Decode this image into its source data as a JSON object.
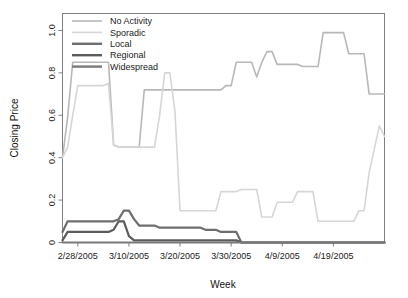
{
  "chart_data": {
    "type": "line",
    "title": "",
    "xlabel": "Week",
    "ylabel": "Closing Price",
    "ylim": [
      0,
      1.08
    ],
    "yticks": [
      0,
      0.2,
      0.4,
      0.6,
      0.8,
      1.0
    ],
    "ytick_labels": [
      "0",
      "0.2",
      "0.4",
      "0.6",
      "0.8",
      "1.0"
    ],
    "xtick_labels": [
      "2/28/2005",
      "3/10/2005",
      "3/20/2005",
      "3/30/2005",
      "4/9/2005",
      "4/19/2005"
    ],
    "xtick_positions": [
      3,
      13,
      23,
      33,
      43,
      53
    ],
    "xlim": [
      0,
      63
    ],
    "grid": false,
    "legend_position": "top-left",
    "series": [
      {
        "name": "No Activity",
        "color": "#b8b8b8",
        "width": 1.6,
        "x": [
          0,
          1,
          2,
          3,
          4,
          5,
          6,
          7,
          8,
          9,
          10,
          11,
          12,
          13,
          14,
          15,
          16,
          17,
          18,
          19,
          20,
          21,
          22,
          23,
          24,
          25,
          26,
          27,
          28,
          29,
          30,
          31,
          32,
          33,
          34,
          35,
          36,
          37,
          38,
          39,
          40,
          41,
          42,
          43,
          44,
          45,
          46,
          47,
          48,
          49,
          50,
          51,
          52,
          53,
          54,
          55,
          56,
          57,
          58,
          59,
          60,
          61,
          62,
          63
        ],
        "values": [
          0.4,
          0.59,
          0.85,
          0.85,
          0.85,
          0.85,
          0.85,
          0.85,
          0.85,
          0.85,
          0.46,
          0.45,
          0.45,
          0.45,
          0.45,
          0.45,
          0.72,
          0.72,
          0.72,
          0.72,
          0.72,
          0.72,
          0.72,
          0.72,
          0.72,
          0.72,
          0.72,
          0.72,
          0.72,
          0.72,
          0.72,
          0.72,
          0.74,
          0.74,
          0.85,
          0.85,
          0.85,
          0.85,
          0.78,
          0.85,
          0.9,
          0.9,
          0.84,
          0.84,
          0.84,
          0.84,
          0.84,
          0.83,
          0.83,
          0.83,
          0.83,
          0.99,
          0.99,
          0.99,
          0.99,
          0.99,
          0.89,
          0.89,
          0.89,
          0.89,
          0.7,
          0.7,
          0.7,
          0.7
        ]
      },
      {
        "name": "Sporadic",
        "color": "#d6d6d6",
        "width": 1.6,
        "x": [
          0,
          1,
          2,
          3,
          4,
          5,
          6,
          7,
          8,
          9,
          10,
          11,
          12,
          13,
          14,
          15,
          16,
          17,
          18,
          19,
          20,
          21,
          22,
          23,
          24,
          25,
          26,
          27,
          28,
          29,
          30,
          31,
          32,
          33,
          34,
          35,
          36,
          37,
          38,
          39,
          40,
          41,
          42,
          43,
          44,
          45,
          46,
          47,
          48,
          49,
          50,
          51,
          52,
          53,
          54,
          55,
          56,
          57,
          58,
          59,
          60,
          61,
          62,
          63
        ],
        "values": [
          0.4,
          0.45,
          0.6,
          0.74,
          0.74,
          0.74,
          0.74,
          0.74,
          0.74,
          0.75,
          0.46,
          0.45,
          0.45,
          0.45,
          0.45,
          0.45,
          0.45,
          0.45,
          0.45,
          0.6,
          0.8,
          0.8,
          0.62,
          0.15,
          0.15,
          0.15,
          0.15,
          0.15,
          0.15,
          0.15,
          0.15,
          0.24,
          0.24,
          0.24,
          0.24,
          0.25,
          0.25,
          0.25,
          0.25,
          0.12,
          0.12,
          0.12,
          0.19,
          0.19,
          0.19,
          0.19,
          0.24,
          0.24,
          0.24,
          0.24,
          0.1,
          0.1,
          0.1,
          0.1,
          0.1,
          0.1,
          0.1,
          0.1,
          0.15,
          0.15,
          0.33,
          0.44,
          0.55,
          0.5
        ]
      },
      {
        "name": "Local",
        "color": "#6e6e6e",
        "width": 2.2,
        "x": [
          0,
          1,
          2,
          3,
          4,
          5,
          6,
          7,
          8,
          9,
          10,
          11,
          12,
          13,
          14,
          15,
          16,
          17,
          18,
          19,
          20,
          21,
          22,
          23,
          24,
          25,
          26,
          27,
          28,
          29,
          30,
          31,
          32,
          33,
          34,
          35,
          36,
          37,
          38,
          39,
          40,
          41,
          42,
          43,
          44,
          45,
          46,
          47,
          48,
          49,
          50,
          51,
          52,
          53,
          54,
          55,
          56,
          57,
          58,
          59,
          60,
          61,
          62,
          63
        ],
        "values": [
          0.05,
          0.1,
          0.1,
          0.1,
          0.1,
          0.1,
          0.1,
          0.1,
          0.1,
          0.1,
          0.1,
          0.11,
          0.15,
          0.15,
          0.11,
          0.08,
          0.08,
          0.08,
          0.08,
          0.07,
          0.07,
          0.07,
          0.07,
          0.07,
          0.07,
          0.07,
          0.07,
          0.07,
          0.06,
          0.06,
          0.06,
          0.05,
          0.05,
          0.05,
          0.05,
          0.0,
          0.0,
          0.0,
          0.0,
          0.0,
          0.0,
          0.0,
          0.0,
          0.0,
          0.0,
          0.0,
          0.0,
          0.0,
          0.0,
          0.0,
          0.0,
          0.0,
          0.0,
          0.0,
          0.0,
          0.0,
          0.0,
          0.0,
          0.0,
          0.0,
          0.0,
          0.0,
          0.0,
          0.0
        ]
      },
      {
        "name": "Regional",
        "color": "#5c5c5c",
        "width": 2.2,
        "x": [
          0,
          1,
          2,
          3,
          4,
          5,
          6,
          7,
          8,
          9,
          10,
          11,
          12,
          13,
          14,
          15,
          16,
          17,
          18,
          19,
          20,
          21,
          22,
          23,
          24,
          25,
          26,
          27,
          28,
          29,
          30,
          31,
          32,
          33,
          34,
          35,
          36,
          37,
          38,
          39,
          40,
          41,
          42,
          43,
          44,
          45,
          46,
          47,
          48,
          49,
          50,
          51,
          52,
          53,
          54,
          55,
          56,
          57,
          58,
          59,
          60,
          61,
          62,
          63
        ],
        "values": [
          0.01,
          0.05,
          0.05,
          0.05,
          0.05,
          0.05,
          0.05,
          0.05,
          0.05,
          0.05,
          0.06,
          0.1,
          0.1,
          0.03,
          0.01,
          0.01,
          0.01,
          0.01,
          0.01,
          0.01,
          0.01,
          0.01,
          0.01,
          0.01,
          0.01,
          0.01,
          0.01,
          0.01,
          0.01,
          0.01,
          0.01,
          0.01,
          0.01,
          0.01,
          0.01,
          0.0,
          0.0,
          0.0,
          0.0,
          0.0,
          0.0,
          0.0,
          0.0,
          0.0,
          0.0,
          0.0,
          0.0,
          0.0,
          0.0,
          0.0,
          0.0,
          0.0,
          0.0,
          0.0,
          0.0,
          0.0,
          0.0,
          0.0,
          0.0,
          0.0,
          0.0,
          0.0,
          0.0,
          0.0
        ]
      },
      {
        "name": "Widespread",
        "color": "#7a7a7a",
        "width": 2.2,
        "x": [
          0,
          1,
          2,
          3,
          4,
          5,
          6,
          7,
          8,
          9,
          10,
          11,
          12,
          13,
          14,
          15,
          16,
          17,
          18,
          19,
          20,
          21,
          22,
          23,
          24,
          25,
          26,
          27,
          28,
          29,
          30,
          31,
          32,
          33,
          34,
          35,
          36,
          37,
          38,
          39,
          40,
          41,
          42,
          43,
          44,
          45,
          46,
          47,
          48,
          49,
          50,
          51,
          52,
          53,
          54,
          55,
          56,
          57,
          58,
          59,
          60,
          61,
          62,
          63
        ],
        "values": [
          0.0,
          0.0,
          0.0,
          0.0,
          0.0,
          0.0,
          0.0,
          0.0,
          0.0,
          0.0,
          0.0,
          0.0,
          0.0,
          0.0,
          0.0,
          0.0,
          0.0,
          0.0,
          0.0,
          0.0,
          0.0,
          0.0,
          0.0,
          0.0,
          0.0,
          0.0,
          0.0,
          0.0,
          0.0,
          0.0,
          0.0,
          0.0,
          0.0,
          0.0,
          0.0,
          0.0,
          0.0,
          0.0,
          0.0,
          0.0,
          0.0,
          0.0,
          0.0,
          0.0,
          0.0,
          0.0,
          0.0,
          0.0,
          0.0,
          0.0,
          0.0,
          0.0,
          0.0,
          0.0,
          0.0,
          0.0,
          0.0,
          0.0,
          0.0,
          0.0,
          0.0,
          0.0,
          0.0,
          0.0
        ]
      }
    ]
  },
  "legend": {
    "items": [
      {
        "label": "No Activity",
        "color": "#b8b8b8"
      },
      {
        "label": "Sporadic",
        "color": "#d6d6d6"
      },
      {
        "label": "Local",
        "color": "#6e6e6e"
      },
      {
        "label": "Regional",
        "color": "#5c5c5c"
      },
      {
        "label": "Widespread",
        "color": "#7a7a7a"
      }
    ]
  },
  "axes": {
    "x_title": "Week",
    "y_title": "Closing Price"
  }
}
